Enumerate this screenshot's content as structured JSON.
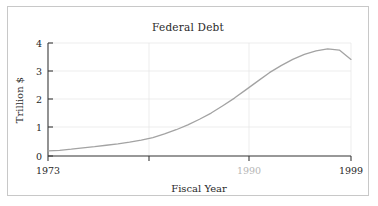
{
  "figure": {
    "title": "Federal Debt"
  },
  "chart_data": {
    "type": "line",
    "title": "Federal Debt",
    "xlabel": "Fiscal Year",
    "ylabel": "Trillion $",
    "xlim": [
      1973,
      1999
    ],
    "ylim": [
      0,
      4
    ],
    "grid": true,
    "legend": "none",
    "x_ticks": [
      {
        "value": 1973,
        "label": "1973",
        "faded": false
      },
      {
        "value": 1990,
        "label": "1990",
        "faded": true
      },
      {
        "value": 1999,
        "label": "1999",
        "faded": false
      }
    ],
    "y_ticks": [
      {
        "value": 0,
        "label": "0"
      },
      {
        "value": 1,
        "label": "1"
      },
      {
        "value": 2,
        "label": "2"
      },
      {
        "value": 3,
        "label": "3"
      },
      {
        "value": 4,
        "label": "4"
      }
    ],
    "series": [
      {
        "name": "Federal Debt",
        "color": "#a3a3a3",
        "x": [
          1973,
          1974,
          1975,
          1976,
          1977,
          1978,
          1979,
          1980,
          1981,
          1982,
          1983,
          1984,
          1985,
          1986,
          1987,
          1988,
          1989,
          1990,
          1991,
          1992,
          1993,
          1994,
          1995,
          1996,
          1997,
          1998,
          1999
        ],
        "values": [
          0.18,
          0.2,
          0.24,
          0.29,
          0.33,
          0.38,
          0.43,
          0.49,
          0.56,
          0.65,
          0.78,
          0.93,
          1.1,
          1.3,
          1.52,
          1.78,
          2.05,
          2.35,
          2.65,
          2.95,
          3.2,
          3.42,
          3.6,
          3.72,
          3.79,
          3.75,
          3.42
        ]
      }
    ]
  },
  "axes": {
    "y_axis_label": "Trillion $",
    "x_axis_label": "Fiscal Year"
  }
}
